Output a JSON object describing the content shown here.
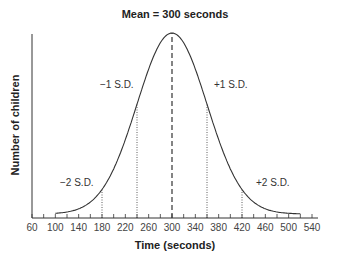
{
  "chart_data": {
    "type": "line",
    "title": "Mean = 300 seconds",
    "xlabel": "Time (seconds)",
    "ylabel": "Number of children",
    "x_ticks": [
      60,
      100,
      140,
      180,
      220,
      260,
      300,
      340,
      380,
      420,
      460,
      500,
      540
    ],
    "xlim": [
      60,
      540
    ],
    "distribution": "normal",
    "mean": 300,
    "sd": 60,
    "annotations": [
      {
        "label": "−2 S.D.",
        "x": 180
      },
      {
        "label": "−1 S.D.",
        "x": 240
      },
      {
        "label": "Mean",
        "x": 300
      },
      {
        "label": "+1 S.D.",
        "x": 360
      },
      {
        "label": "+2 S.D.",
        "x": 420
      }
    ],
    "grid": false,
    "legend": null
  },
  "labels": {
    "title": "Mean = 300 seconds",
    "xlabel": "Time (seconds)",
    "ylabel": "Number of children",
    "sd_minus2": "−2 S.D.",
    "sd_minus1": "−1 S.D.",
    "sd_plus1": "+1 S.D.",
    "sd_plus2": "+2 S.D."
  }
}
